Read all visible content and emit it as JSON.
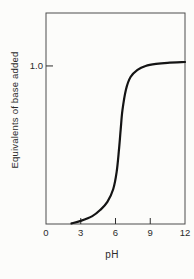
{
  "figure": {
    "background": "#fcfcfa",
    "curve_color": "#141414",
    "frame_color": "#4d4d4d",
    "tick_color": "#2e2e2e",
    "text_color": "#2b2b2b"
  },
  "chart_data": {
    "type": "line",
    "title": "",
    "xlabel": "pH",
    "ylabel": "Equivalents of base added",
    "xlim": [
      0,
      12
    ],
    "ylim": [
      0,
      1.335
    ],
    "grid": false,
    "frame": "box",
    "legend": "none",
    "xtick_values": [
      0,
      3,
      6,
      9,
      12
    ],
    "xtick_labels": [
      "0",
      "3",
      "6",
      "9",
      "12"
    ],
    "xtick_marks": [
      3,
      6,
      9
    ],
    "ytick_values": [
      1.0
    ],
    "ytick_labels": [
      "1.0"
    ],
    "series": [
      {
        "name": "titration-curve",
        "x": [
          2.2,
          3.0,
          4.0,
          4.7,
          5.3,
          5.8,
          6.1,
          6.3,
          6.45,
          6.6,
          6.9,
          7.3,
          7.9,
          8.6,
          9.5,
          10.5,
          12.0
        ],
        "y": [
          0.004,
          0.02,
          0.05,
          0.09,
          0.14,
          0.22,
          0.33,
          0.47,
          0.6,
          0.72,
          0.85,
          0.93,
          0.975,
          1.0,
          1.013,
          1.02,
          1.025
        ]
      }
    ],
    "annotations": {
      "midpoint_pH": 6.4,
      "equivalence_plateau": 1.02
    }
  }
}
